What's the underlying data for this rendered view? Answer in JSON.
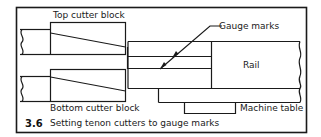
{
  "figure": {
    "number": "3.6",
    "caption": "Setting tenon cutters to gauge marks"
  },
  "labels": {
    "top_cutter_block": "Top cutter block",
    "bottom_cutter_block": "Bottom cutter block",
    "gauge_marks": "Gauge marks",
    "rail": "Rail",
    "machine_table": "Machine table"
  },
  "colors": {
    "line": "#1a1a1a",
    "background": "#ffffff"
  }
}
